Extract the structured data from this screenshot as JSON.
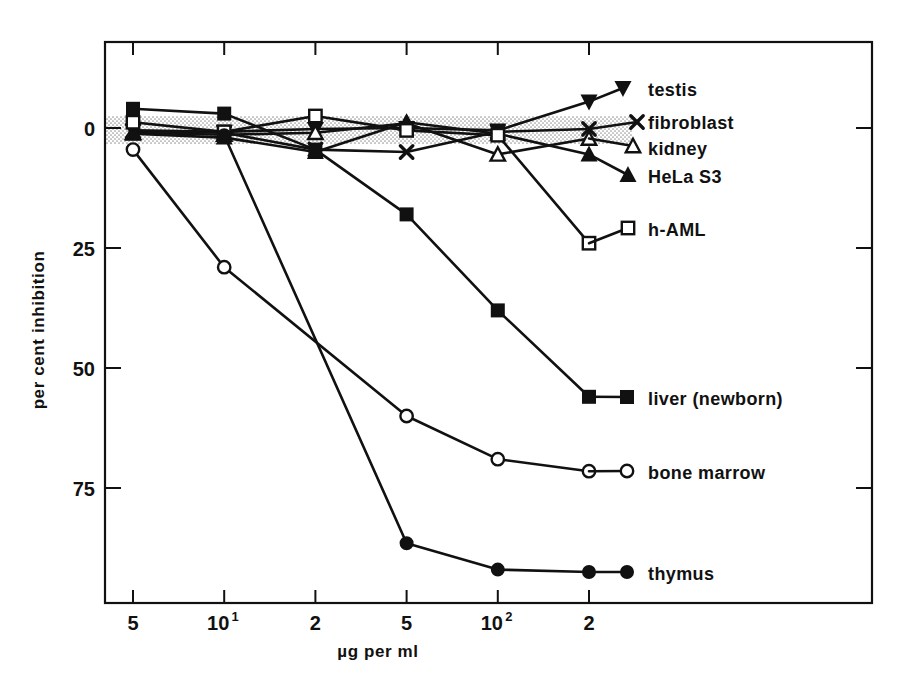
{
  "chart_data": {
    "type": "line",
    "title": "",
    "xlabel": "µg per ml",
    "ylabel": "per cent inhibition",
    "xscale": "log",
    "xlim": [
      4.0,
      320.0
    ],
    "ylim": [
      -8,
      95
    ],
    "yticks": [
      0,
      25,
      50,
      75
    ],
    "ytick_labels": [
      "0",
      "25",
      "50",
      "75"
    ],
    "xticks": [
      5,
      10,
      20,
      50,
      100,
      200
    ],
    "xtick_labels": [
      "5",
      "10",
      "2",
      "5",
      "10",
      "2"
    ],
    "xtick_sup": [
      "",
      "1",
      "",
      "",
      "2",
      ""
    ],
    "grid": false,
    "legend_position": "right-inline",
    "annotations": [
      {
        "name": "baseline-band",
        "label": "shaded zero band",
        "y_from": -3,
        "y_to": 3
      }
    ],
    "series": [
      {
        "name": "testis",
        "marker": "filled-triangle-down",
        "x": [
          5,
          10,
          20,
          50,
          100,
          200
        ],
        "values": [
          0.5,
          0.8,
          0.2,
          0.0,
          0.5,
          -5.5
        ]
      },
      {
        "name": "fibroblast",
        "marker": "x",
        "x": [
          5,
          10,
          20,
          50,
          100,
          200
        ],
        "values": [
          0.6,
          1.0,
          4.5,
          5.0,
          0.8,
          0.2
        ]
      },
      {
        "name": "kidney",
        "marker": "open-triangle-up",
        "x": [
          5,
          10,
          20,
          50,
          100,
          200
        ],
        "values": [
          1.0,
          1.4,
          1.0,
          -1.0,
          5.5,
          2.2
        ]
      },
      {
        "name": "HeLa S3",
        "marker": "filled-triangle-up",
        "x": [
          5,
          10,
          20,
          50,
          100,
          200
        ],
        "values": [
          1.2,
          2.0,
          5.0,
          -1.2,
          1.2,
          5.5
        ]
      },
      {
        "name": "h-AML",
        "marker": "open-square",
        "x": [
          5,
          10,
          20,
          50,
          100,
          200
        ],
        "values": [
          -1.2,
          0.8,
          -2.5,
          0.5,
          1.5,
          24.0
        ]
      },
      {
        "name": "liver (newborn)",
        "marker": "filled-square",
        "x": [
          5,
          10,
          20,
          50,
          100,
          200
        ],
        "values": [
          -4.0,
          -3.0,
          4.5,
          18.0,
          38.0,
          56.0
        ]
      },
      {
        "name": "bone marrow",
        "marker": "open-circle",
        "x": [
          5,
          10,
          50,
          100,
          200
        ],
        "values": [
          4.5,
          29.0,
          60.0,
          69.0,
          71.5
        ]
      },
      {
        "name": "thymus",
        "marker": "filled-circle",
        "x": [
          10,
          50,
          100,
          200
        ],
        "values": [
          1.5,
          86.5,
          92.0,
          92.5
        ]
      }
    ]
  },
  "legend": {
    "entries": [
      {
        "label": "testis",
        "marker": "filled-triangle-down"
      },
      {
        "label": "fibroblast",
        "marker": "x"
      },
      {
        "label": "kidney",
        "marker": "open-triangle-up"
      },
      {
        "label": "HeLa S3",
        "marker": "filled-triangle-up"
      },
      {
        "label": "h-AML",
        "marker": "open-square"
      },
      {
        "label": "liver (newborn)",
        "marker": "filled-square"
      },
      {
        "label": "bone marrow",
        "marker": "open-circle"
      },
      {
        "label": "thymus",
        "marker": "filled-circle"
      }
    ]
  },
  "colors": {
    "ink": "#111111",
    "background": "#ffffff",
    "band": "#cfcfcf"
  }
}
